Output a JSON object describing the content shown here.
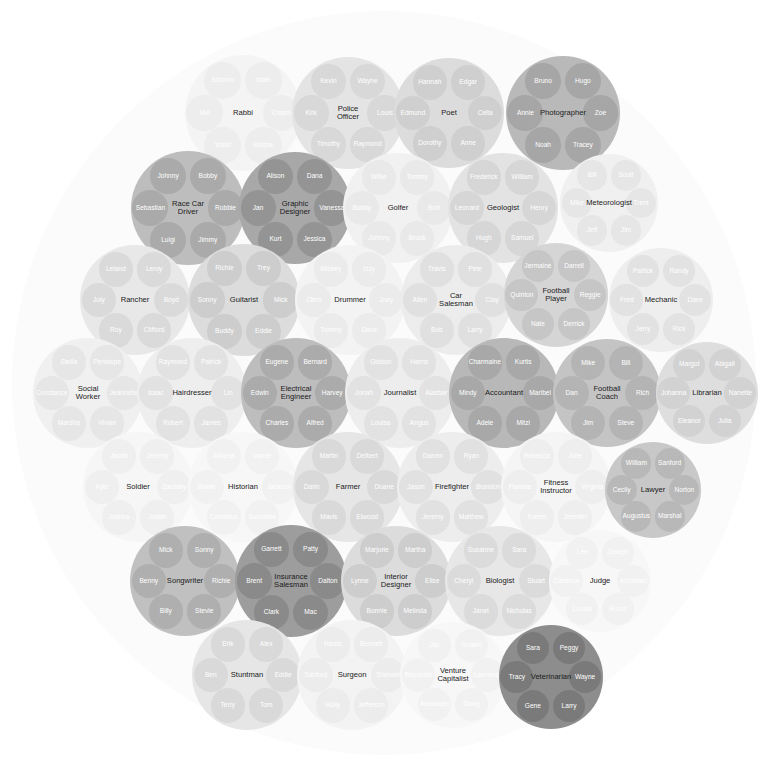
{
  "canvas": {
    "width": 768,
    "height": 770,
    "background": "#ffffff"
  },
  "outer_circle": {
    "cx": 384,
    "cy": 383,
    "r": 372,
    "fill": "#fbfbfb"
  },
  "chart_data": {
    "type": "circle-packing",
    "title": "",
    "layout": "packed circles inside one enclosing circle",
    "legend": null,
    "value_encoding": "fill lightness",
    "group_radius_px": 57,
    "child_radius_px": 18,
    "groups": [
      {
        "label": "Rabbi",
        "cx": 243,
        "cy": 113,
        "r": 58,
        "fill": "#f4f4f4",
        "child_fill": "#ededed",
        "members": [
          "Isiah",
          "Shlomo",
          "Mel",
          "Chaim",
          "Yosef",
          "Moshe"
        ]
      },
      {
        "label": "Police\nOfficer",
        "cx": 348,
        "cy": 113,
        "r": 56,
        "fill": "#e4e4e4",
        "child_fill": "#d8d8d8",
        "members": [
          "Wayne",
          "Kevin",
          "Kirk",
          "Louis",
          "Timothy",
          "Raymond"
        ]
      },
      {
        "label": "Poet",
        "cx": 449,
        "cy": 113,
        "r": 55,
        "fill": "#dcdcdc",
        "child_fill": "#cfcfcf",
        "members": [
          "Edgar",
          "Hannah",
          "Edmund",
          "Celia",
          "Dorothy",
          "Anne"
        ]
      },
      {
        "label": "Photographer",
        "cx": 563,
        "cy": 113,
        "r": 57,
        "fill": "#b9b9b9",
        "child_fill": "#a6a6a6",
        "members": [
          "Hugo",
          "Bruno",
          "Annie",
          "Zoe",
          "Noah",
          "Tracey"
        ]
      },
      {
        "label": "Race Car\nDriver",
        "cx": 188,
        "cy": 208,
        "r": 57,
        "fill": "#bdbdbd",
        "child_fill": "#aaaaaa",
        "members": [
          "Bobby",
          "Johnny",
          "Sebastian",
          "Robbie",
          "Luigi",
          "Jimmy"
        ]
      },
      {
        "label": "Graphic\nDesigner",
        "cx": 295,
        "cy": 208,
        "r": 56,
        "fill": "#a8a8a8",
        "child_fill": "#949494",
        "members": [
          "Dana",
          "Alison",
          "Jan",
          "Vanessa",
          "Kurt",
          "Jessica"
        ]
      },
      {
        "label": "Golfer",
        "cx": 398,
        "cy": 208,
        "r": 55,
        "fill": "#f1f1f1",
        "child_fill": "#e9e9e9",
        "members": [
          "Tommy",
          "Willie",
          "Bobby",
          "Burt",
          "Johnny",
          "Brook"
        ]
      },
      {
        "label": "Geologist",
        "cx": 503,
        "cy": 208,
        "r": 55,
        "fill": "#e3e3e3",
        "child_fill": "#d6d6d6",
        "members": [
          "William",
          "Frederick",
          "Leonard",
          "Henry",
          "Hugh",
          "Samuel"
        ]
      },
      {
        "label": "Meteorologist",
        "cx": 609,
        "cy": 203,
        "r": 49,
        "fill": "#f0f0f0",
        "child_fill": "#e6e6e6",
        "members": [
          "Scott",
          "Bill",
          "Mike",
          "Trent",
          "Jeff",
          "Jim"
        ]
      },
      {
        "label": "Rancher",
        "cx": 135,
        "cy": 300,
        "r": 55,
        "fill": "#e8e8e8",
        "child_fill": "#dadada",
        "members": [
          "Leroy",
          "Leland",
          "July",
          "Boyd",
          "Roy",
          "Clifford"
        ]
      },
      {
        "label": "Guitarist",
        "cx": 244,
        "cy": 300,
        "r": 56,
        "fill": "#dcdcdc",
        "child_fill": "#cdcdcd",
        "members": [
          "Trey",
          "Richie",
          "Sonny",
          "Mick",
          "Buddy",
          "Eddie"
        ]
      },
      {
        "label": "Drummer",
        "cx": 350,
        "cy": 300,
        "r": 55,
        "fill": "#f3f3f3",
        "child_fill": "#ebebeb",
        "members": [
          "Izzy",
          "Mickey",
          "Clem",
          "Joey",
          "Tommy",
          "Dave"
        ]
      },
      {
        "label": "Car\nSalesman",
        "cx": 456,
        "cy": 300,
        "r": 55,
        "fill": "#ececec",
        "child_fill": "#e0e0e0",
        "members": [
          "Pete",
          "Travis",
          "Allen",
          "Clay",
          "Bob",
          "Larry"
        ]
      },
      {
        "label": "Football\nPlayer",
        "cx": 556,
        "cy": 295,
        "r": 52,
        "fill": "#d5d5d5",
        "child_fill": "#c6c6c6",
        "members": [
          "Darrell",
          "Jermaine",
          "Quinton",
          "Reggie",
          "Nate",
          "Derrick"
        ]
      },
      {
        "label": "Mechanic",
        "cx": 661,
        "cy": 300,
        "r": 52,
        "fill": "#eeeeee",
        "child_fill": "#e2e2e2",
        "members": [
          "Randy",
          "Patrick",
          "Fred",
          "Dave",
          "Jerry",
          "Rick"
        ]
      },
      {
        "label": "Social\nWorker",
        "cx": 88,
        "cy": 393,
        "r": 55,
        "fill": "#f0f0f0",
        "child_fill": "#e6e6e6",
        "members": [
          "Penelope",
          "Stella",
          "Constance",
          "Jeannette",
          "Marsha",
          "Vivian"
        ]
      },
      {
        "label": "Hairdresser",
        "cx": 192,
        "cy": 393,
        "r": 55,
        "fill": "#eeeeee",
        "child_fill": "#e2e2e2",
        "members": [
          "Patrick",
          "Raymond",
          "Isaac",
          "Lin",
          "Robert",
          "James"
        ]
      },
      {
        "label": "Electrical\nEngineer",
        "cx": 296,
        "cy": 393,
        "r": 55,
        "fill": "#bdbdbd",
        "child_fill": "#ababab",
        "members": [
          "Bernard",
          "Eugene",
          "Edwin",
          "Harvey",
          "Charles",
          "Alfred"
        ]
      },
      {
        "label": "Journalist",
        "cx": 400,
        "cy": 393,
        "r": 55,
        "fill": "#ededed",
        "child_fill": "#e2e2e2",
        "members": [
          "Harris",
          "Gideon",
          "Jonah",
          "Alastair",
          "Louisa",
          "Angus"
        ]
      },
      {
        "label": "Accountant",
        "cx": 504,
        "cy": 393,
        "r": 55,
        "fill": "#b8b8b8",
        "child_fill": "#a8a8a8",
        "members": [
          "Kurtis",
          "Charmaine",
          "Mindy",
          "Maribel",
          "Adele",
          "Mitzi"
        ]
      },
      {
        "label": "Football\nCoach",
        "cx": 607,
        "cy": 393,
        "r": 54,
        "fill": "#c4c4c4",
        "child_fill": "#b4b4b4",
        "members": [
          "Bill",
          "Mike",
          "Dan",
          "Rich",
          "Jim",
          "Steve"
        ]
      },
      {
        "label": "Librarian",
        "cx": 707,
        "cy": 393,
        "r": 51,
        "fill": "#dedede",
        "child_fill": "#d2d2d2",
        "members": [
          "Abigail",
          "Margot",
          "Johanna",
          "Nanette",
          "Eleanor",
          "Julia"
        ]
      },
      {
        "label": "Soldier",
        "cx": 138,
        "cy": 487,
        "r": 55,
        "fill": "#f6f6f6",
        "child_fill": "#efefef",
        "members": [
          "Jeremy",
          "Jacob",
          "Kyle",
          "Zachary",
          "Joshua",
          "Judah"
        ]
      },
      {
        "label": "Historian",
        "cx": 243,
        "cy": 487,
        "r": 55,
        "fill": "#f7f7f7",
        "child_fill": "#f1f1f1",
        "members": [
          "Vance",
          "Athena",
          "Bowie",
          "Jackson",
          "Cornelius",
          "Sunshine"
        ]
      },
      {
        "label": "Farmer",
        "cx": 348,
        "cy": 487,
        "r": 55,
        "fill": "#e6e6e6",
        "child_fill": "#d9d9d9",
        "members": [
          "Delbert",
          "Martin",
          "Darin",
          "Duane",
          "Mavis",
          "Elwood"
        ]
      },
      {
        "label": "Firefighter",
        "cx": 452,
        "cy": 487,
        "r": 55,
        "fill": "#ededed",
        "child_fill": "#e1e1e1",
        "members": [
          "Ryan",
          "Darren",
          "Jason",
          "Brandon",
          "Jeremy",
          "Matthew"
        ]
      },
      {
        "label": "Fitness\nInstructor",
        "cx": 556,
        "cy": 487,
        "r": 55,
        "fill": "#f5f5f5",
        "child_fill": "#eeeeee",
        "members": [
          "Julie",
          "Rebecca",
          "Pamela",
          "Virginia",
          "Karen",
          "Jennifer"
        ]
      },
      {
        "label": "Lawyer",
        "cx": 653,
        "cy": 490,
        "r": 48,
        "fill": "#c8c8c8",
        "child_fill": "#b8b8b8",
        "members": [
          "Sanford",
          "William",
          "Cecily",
          "Norton",
          "Augustus",
          "Marshal"
        ]
      },
      {
        "label": "Songwriter",
        "cx": 185,
        "cy": 581,
        "r": 55,
        "fill": "#c0c0c0",
        "child_fill": "#afafaf",
        "members": [
          "Sonny",
          "Mick",
          "Benny",
          "Richie",
          "Billy",
          "Stevie"
        ]
      },
      {
        "label": "Insurance\nSalesman",
        "cx": 291,
        "cy": 581,
        "r": 56,
        "fill": "#9d9d9d",
        "child_fill": "#8a8a8a",
        "members": [
          "Patty",
          "Garrett",
          "Brent",
          "Dalton",
          "Clark",
          "Mac"
        ]
      },
      {
        "label": "Interior\nDesigner",
        "cx": 396,
        "cy": 581,
        "r": 55,
        "fill": "#dcdcdc",
        "child_fill": "#cdcdcd",
        "members": [
          "Martha",
          "Marjorie",
          "Lynne",
          "Elise",
          "Bonnie",
          "Melinda"
        ]
      },
      {
        "label": "Biologist",
        "cx": 500,
        "cy": 581,
        "r": 55,
        "fill": "#e7e7e7",
        "child_fill": "#dbdbdb",
        "members": [
          "Sara",
          "Susanne",
          "Cheryl",
          "Stuart",
          "Janet",
          "Nicholas"
        ]
      },
      {
        "label": "Judge",
        "cx": 600,
        "cy": 581,
        "r": 51,
        "fill": "#f7f7f7",
        "child_fill": "#f1f1f1",
        "members": [
          "Joseph",
          "Lee",
          "Clarence",
          "Archibald",
          "Louise",
          "Rufus"
        ]
      },
      {
        "label": "Stuntman",
        "cx": 247,
        "cy": 675,
        "r": 55,
        "fill": "#e6e6e6",
        "child_fill": "#d9d9d9",
        "members": [
          "Alex",
          "Erik",
          "Ben",
          "Eddie",
          "Terry",
          "Tom"
        ]
      },
      {
        "label": "Surgeon",
        "cx": 352,
        "cy": 675,
        "r": 55,
        "fill": "#f3f3f3",
        "child_fill": "#ececec",
        "members": [
          "Bennett",
          "Harris",
          "Sanford",
          "Sherwin",
          "Holly",
          "Jefferson"
        ]
      },
      {
        "label": "Venture\nCapitalist",
        "cx": 453,
        "cy": 675,
        "r": 53,
        "fill": "#f7f7f7",
        "child_fill": "#f1f1f1",
        "members": [
          "Shawn",
          "Jay",
          "Reynolds",
          "Lawrence",
          "Alexander",
          "Doug"
        ]
      },
      {
        "label": "Veterinarian",
        "cx": 551,
        "cy": 677,
        "r": 52,
        "fill": "#8d8d8d",
        "child_fill": "#7a7a7a",
        "members": [
          "Peggy",
          "Sara",
          "Tracy",
          "Wayne",
          "Gene",
          "Larry"
        ]
      }
    ]
  }
}
